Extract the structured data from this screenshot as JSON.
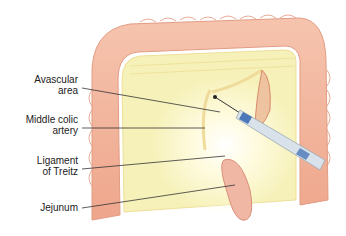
{
  "labels": {
    "avascular_area": [
      "Avascular",
      "area"
    ],
    "middle_colic_artery": [
      "Middle colic",
      "artery"
    ],
    "ligament_of_treitz": [
      "Ligament",
      "of Treitz"
    ],
    "jejunum": [
      "Jejunum"
    ]
  },
  "colors": {
    "colon": "#f2b39a",
    "colon_shadow": "#e69a80",
    "mesentery": "#f6f1b8",
    "glow": "#fffbe0",
    "vessel": "#e8a07a",
    "instrument": "#d9e2ea",
    "instrument_band": "#4a78b8",
    "leader_line": "#333333"
  }
}
